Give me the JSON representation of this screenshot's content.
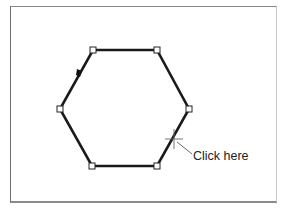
{
  "diagram": {
    "shape": "hexagon",
    "stroke_color": "#1a1a1a",
    "handle_fill": "#ffffff",
    "vertices": [
      [
        93,
        50
      ],
      [
        157,
        50
      ],
      [
        189,
        109
      ],
      [
        157,
        166
      ],
      [
        92,
        166
      ],
      [
        60,
        109
      ]
    ],
    "direction_marker": [
      79,
      72
    ],
    "cursor": [
      174,
      139
    ],
    "annotation": {
      "label": "Click here"
    }
  }
}
